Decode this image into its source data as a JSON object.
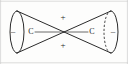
{
  "figure": {
    "background_color": "#fdfdfc",
    "line_color": "#2b2b2b",
    "frame_color": "#cfcfcf",
    "labels": {
      "left_atom": "C",
      "right_atom": "C",
      "top_sign": "+",
      "bottom_sign": "+",
      "left_outer_sign": "–",
      "right_outer_sign": "–"
    },
    "geometry": {
      "apex_x": 64,
      "apex_y": 32,
      "left_cap_center_x": 17,
      "right_cap_center_x": 111,
      "cap_rx": 7,
      "cap_ry": 21,
      "left_atom_x": 31,
      "left_atom_y": 32,
      "right_atom_x": 92,
      "right_atom_y": 32,
      "top_sign_x": 63,
      "top_sign_y": 18,
      "bottom_sign_x": 63,
      "bottom_sign_y": 46,
      "left_sign_x": 13,
      "left_sign_y": 32,
      "right_sign_x": 113,
      "right_sign_y": 32
    },
    "elements": [
      "left-cone",
      "right-cone",
      "left-ellipse-cap",
      "right-ellipse-cap",
      "bond-axis",
      "charge-signs"
    ]
  }
}
